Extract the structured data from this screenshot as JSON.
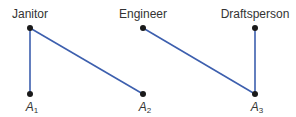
{
  "colors": {
    "edge": "#3d5fae",
    "node": "#1a1a1a",
    "text": "#333333",
    "background": "#ffffff"
  },
  "top_nodes": [
    {
      "id": "janitor",
      "label": "Janitor",
      "x": 30,
      "y": 28
    },
    {
      "id": "engineer",
      "label": "Engineer",
      "x": 143,
      "y": 28
    },
    {
      "id": "draftsperson",
      "label": "Draftsperson",
      "x": 255,
      "y": 28
    }
  ],
  "bottom_nodes": [
    {
      "id": "a1",
      "label": "A",
      "sub": "1",
      "x": 30,
      "y": 94
    },
    {
      "id": "a2",
      "label": "A",
      "sub": "2",
      "x": 143,
      "y": 94
    },
    {
      "id": "a3",
      "label": "A",
      "sub": "3",
      "x": 255,
      "y": 94
    }
  ],
  "edges": [
    {
      "from": "janitor",
      "to": "a1"
    },
    {
      "from": "janitor",
      "to": "a2"
    },
    {
      "from": "engineer",
      "to": "a3"
    },
    {
      "from": "draftsperson",
      "to": "a3"
    }
  ]
}
